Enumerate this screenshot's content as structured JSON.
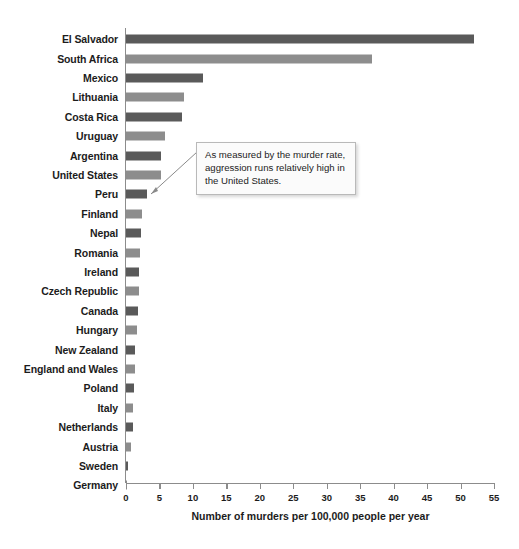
{
  "chart_data": {
    "type": "bar",
    "orientation": "horizontal",
    "title": "",
    "xlabel": "Number of murders per 100,000 people per year",
    "ylabel": "",
    "xlim": [
      0,
      55
    ],
    "xticks": [
      0,
      5,
      10,
      15,
      20,
      25,
      30,
      35,
      40,
      45,
      50,
      55
    ],
    "grid": false,
    "legend": false,
    "categories": [
      "El Salvador",
      "South Africa",
      "Mexico",
      "Lithuania",
      "Costa Rica",
      "Uruguay",
      "Argentina",
      "United States",
      "Peru",
      "Finland",
      "Nepal",
      "Romania",
      "Ireland",
      "Czech Republic",
      "Canada",
      "Hungary",
      "New Zealand",
      "England and Wales",
      "Poland",
      "Italy",
      "Netherlands",
      "Austria",
      "Sweden",
      "Germany"
    ],
    "values": [
      52.0,
      36.8,
      11.5,
      8.6,
      8.3,
      5.8,
      5.3,
      5.2,
      3.2,
      2.4,
      2.3,
      2.1,
      2.0,
      1.9,
      1.8,
      1.6,
      1.4,
      1.3,
      1.2,
      1.1,
      1.1,
      0.8,
      0.3,
      0.2
    ],
    "bar_shades": [
      "dark",
      "light",
      "dark",
      "light",
      "dark",
      "light",
      "dark",
      "light",
      "dark",
      "light",
      "dark",
      "light",
      "dark",
      "light",
      "dark",
      "light",
      "dark",
      "light",
      "dark",
      "light",
      "dark",
      "light",
      "dark",
      "light"
    ],
    "annotations": [
      {
        "text": "As measured by the murder rate, aggression runs relatively high in the United States.",
        "points_to": "United States"
      }
    ]
  },
  "colors": {
    "bar_dark": "#5a5a5a",
    "bar_light": "#8d8d8d",
    "axis": "#8c8c8c",
    "text": "#1c1c1c",
    "annotation_bg": "#fbfbfb",
    "annotation_border": "#b9b9b9"
  }
}
